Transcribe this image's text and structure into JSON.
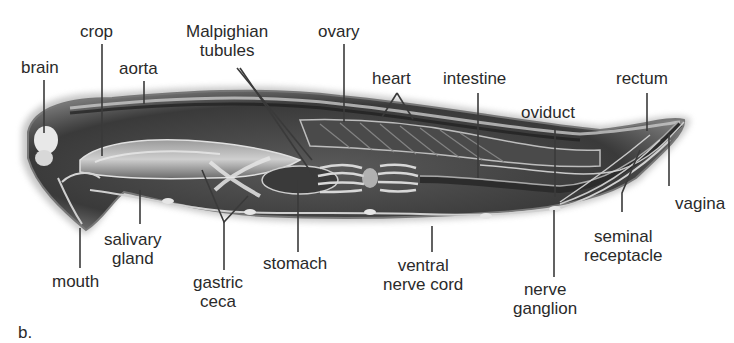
{
  "figure": {
    "panel_label": "b.",
    "colors": {
      "background": "#ffffff",
      "body_dark": "#2b2b2b",
      "body_mid": "#6e6e6e",
      "body_light": "#b8b8b8",
      "leader_line": "#3a3a3a",
      "label_text": "#2a2a2a"
    }
  },
  "labels": {
    "brain": "brain",
    "crop": "crop",
    "aorta": "aorta",
    "malpighian_1": "Malpighian",
    "malpighian_2": "tubules",
    "ovary": "ovary",
    "heart": "heart",
    "intestine": "intestine",
    "rectum": "rectum",
    "oviduct": "oviduct",
    "vagina": "vagina",
    "seminal_1": "seminal",
    "seminal_2": "receptacle",
    "mouth": "mouth",
    "salivary_1": "salivary",
    "salivary_2": "gland",
    "gastric_1": "gastric",
    "gastric_2": "ceca",
    "stomach": "stomach",
    "ventral_1": "ventral",
    "ventral_2": "nerve cord",
    "nerve_1": "nerve",
    "nerve_2": "ganglion"
  }
}
